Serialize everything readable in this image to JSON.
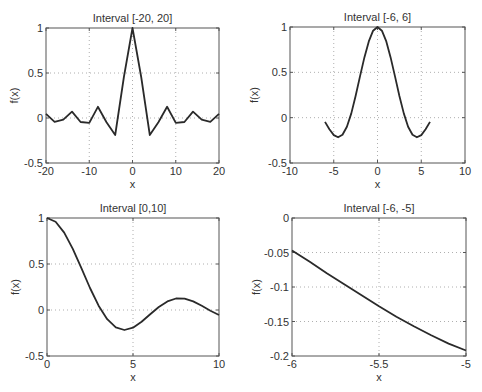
{
  "figure": {
    "background": "#ffffff",
    "line_color": "#2a2a2a",
    "axis_color": "#555555",
    "grid_color": "#9a9a9a"
  },
  "chart_data": [
    {
      "type": "line",
      "title": "Interval [-20, 20]",
      "xlabel": "x",
      "ylabel": "f(x)",
      "xlim": [
        -20,
        20
      ],
      "ylim": [
        -0.5,
        1
      ],
      "xticks": [
        -20,
        -10,
        0,
        10,
        20
      ],
      "xtick_labels": [
        "-20",
        "-10",
        "0",
        "10",
        "20"
      ],
      "yticks": [
        -0.5,
        0,
        0.5,
        1
      ],
      "ytick_labels": [
        "-0.5",
        "0",
        "0.5",
        "1"
      ],
      "grid": true,
      "box": {
        "left": 46,
        "top": 28,
        "right": 219,
        "bottom": 163
      },
      "x": [
        -20,
        -18,
        -16,
        -14,
        -12,
        -10,
        -8,
        -6,
        -4,
        -2,
        0,
        2,
        4,
        6,
        8,
        10,
        12,
        14,
        16,
        18,
        20
      ],
      "y": [
        0.046,
        -0.042,
        -0.018,
        0.071,
        -0.045,
        -0.054,
        0.124,
        -0.047,
        -0.189,
        0.455,
        1.0,
        0.455,
        -0.189,
        -0.047,
        0.124,
        -0.054,
        -0.045,
        0.071,
        -0.018,
        -0.042,
        0.046
      ]
    },
    {
      "type": "line",
      "title": "Interval [-6, 6]",
      "xlabel": "x",
      "ylabel": "f(x)",
      "xlim": [
        -10,
        10
      ],
      "ylim": [
        -0.5,
        1
      ],
      "xticks": [
        -10,
        -5,
        0,
        5,
        10
      ],
      "xtick_labels": [
        "-10",
        "-5",
        "0",
        "5",
        "10"
      ],
      "yticks": [
        -0.5,
        0,
        0.5,
        1
      ],
      "ytick_labels": [
        "-0.5",
        "0",
        "0.5",
        "1"
      ],
      "grid": true,
      "box": {
        "left": 290,
        "top": 27,
        "right": 465,
        "bottom": 163
      },
      "x": [
        -6,
        -5.5,
        -5,
        -4.5,
        -4,
        -3.5,
        -3,
        -2.5,
        -2,
        -1.5,
        -1,
        -0.5,
        0,
        0.5,
        1,
        1.5,
        2,
        2.5,
        3,
        3.5,
        4,
        4.5,
        5,
        5.5,
        6
      ],
      "y": [
        -0.047,
        -0.128,
        -0.192,
        -0.217,
        -0.189,
        -0.1,
        0.047,
        0.239,
        0.455,
        0.665,
        0.841,
        0.959,
        1.0,
        0.959,
        0.841,
        0.665,
        0.455,
        0.239,
        0.047,
        -0.1,
        -0.189,
        -0.217,
        -0.192,
        -0.128,
        -0.047
      ]
    },
    {
      "type": "line",
      "title": "Interval [0,10]",
      "xlabel": "x",
      "ylabel": "f(x)",
      "xlim": [
        0,
        10
      ],
      "ylim": [
        -0.5,
        1
      ],
      "xticks": [
        0,
        5,
        10
      ],
      "xtick_labels": [
        "0",
        "5",
        "10"
      ],
      "yticks": [
        -0.5,
        0,
        0.5,
        1
      ],
      "ytick_labels": [
        "-0.5",
        "0",
        "0.5",
        "1"
      ],
      "grid": true,
      "box": {
        "left": 47,
        "top": 218,
        "right": 219,
        "bottom": 356
      },
      "x": [
        0,
        0.5,
        1,
        1.5,
        2,
        2.5,
        3,
        3.5,
        4,
        4.5,
        5,
        5.5,
        6,
        6.5,
        7,
        7.5,
        8,
        8.5,
        9,
        9.5,
        10
      ],
      "y": [
        1.0,
        0.959,
        0.841,
        0.665,
        0.455,
        0.239,
        0.047,
        -0.1,
        -0.189,
        -0.217,
        -0.192,
        -0.128,
        -0.047,
        0.033,
        0.094,
        0.125,
        0.124,
        0.094,
        0.046,
        -0.008,
        -0.054
      ]
    },
    {
      "type": "line",
      "title": "Interval [-6, -5]",
      "xlabel": "x",
      "ylabel": "f(x)",
      "xlim": [
        -6,
        -5
      ],
      "ylim": [
        -0.2,
        0
      ],
      "xticks": [
        -6,
        -5.5,
        -5
      ],
      "xtick_labels": [
        "-6",
        "-5.5",
        "-5"
      ],
      "yticks": [
        -0.2,
        -0.15,
        -0.1,
        -0.05,
        0
      ],
      "ytick_labels": [
        "-0.2",
        "-0.15",
        "-0.1",
        "-0.05",
        "0"
      ],
      "grid": true,
      "box": {
        "left": 292,
        "top": 218,
        "right": 466,
        "bottom": 356
      },
      "x": [
        -6,
        -5.9,
        -5.8,
        -5.7,
        -5.6,
        -5.5,
        -5.4,
        -5.3,
        -5.2,
        -5.1,
        -5
      ],
      "y": [
        -0.047,
        -0.063,
        -0.08,
        -0.096,
        -0.112,
        -0.128,
        -0.143,
        -0.157,
        -0.17,
        -0.182,
        -0.192
      ]
    }
  ]
}
